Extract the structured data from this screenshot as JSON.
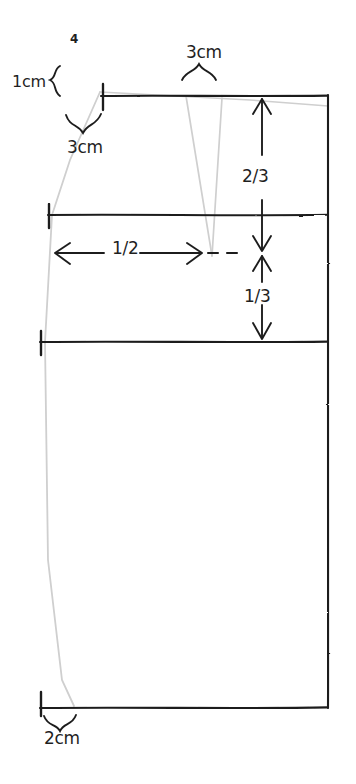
{
  "diagram": {
    "type": "hand-drawn-pattern-draft",
    "piece_number": "4",
    "colors": {
      "ink": "#1f1f1f",
      "construction_line": "#c9c9c9",
      "background": "#ffffff"
    },
    "labels": [
      {
        "id": "piece-number",
        "text": "4",
        "x": 70,
        "y": 33
      },
      {
        "id": "shoulder-slope",
        "text": "1cm",
        "x": 12,
        "y": 74
      },
      {
        "id": "neck-width",
        "text": "3cm",
        "x": 67,
        "y": 139
      },
      {
        "id": "dart-width",
        "text": "3cm",
        "x": 186,
        "y": 44
      },
      {
        "id": "upper-division",
        "text": "2/3",
        "x": 242,
        "y": 168
      },
      {
        "id": "lower-division",
        "text": "1/3",
        "x": 244,
        "y": 288
      },
      {
        "id": "half-width",
        "text": "1/2",
        "x": 112,
        "y": 240
      },
      {
        "id": "hem-extension",
        "text": "2cm",
        "x": 44,
        "y": 730
      }
    ],
    "measurements": {
      "shoulder_slope": "1cm",
      "neck_width": "3cm",
      "dart_width": "3cm",
      "upper_section": "2/3",
      "lower_section": "1/3",
      "center_half": "1/2",
      "hem_extension": "2cm"
    },
    "guides": {
      "top_line_y": 96,
      "waist_line_y": 215,
      "hip_line_y": 342,
      "hem_line_y": 708,
      "left_edge_x": 45,
      "right_edge_x": 328,
      "crosshair_x": 262,
      "crosshair_y": 253
    }
  }
}
